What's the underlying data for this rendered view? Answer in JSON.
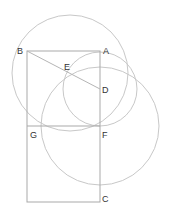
{
  "diagram": {
    "type": "geometric-construction",
    "points": {
      "A": {
        "label": "A",
        "x": 100,
        "y": 51
      },
      "B": {
        "label": "B",
        "x": 27,
        "y": 51
      },
      "C": {
        "label": "C",
        "x": 100,
        "y": 202
      },
      "D": {
        "label": "D",
        "x": 100,
        "y": 89
      },
      "E": {
        "label": "E",
        "x": 70,
        "y": 73
      },
      "F": {
        "label": "F",
        "x": 100,
        "y": 126
      },
      "G": {
        "label": "G",
        "x": 27,
        "y": 126
      }
    },
    "rectangle": {
      "corners": [
        "B",
        "A",
        "C"
      ],
      "x": 27,
      "y": 51,
      "width": 73,
      "height": 151
    },
    "segments": [
      {
        "from": "B",
        "to": "D"
      },
      {
        "from": "G",
        "to": "F"
      }
    ],
    "circles": [
      {
        "name": "circle-center-E",
        "cx": 70,
        "cy": 73,
        "r": 58
      },
      {
        "name": "circle-center-D",
        "cx": 100,
        "cy": 89,
        "r": 37
      },
      {
        "name": "circle-center-F",
        "cx": 100,
        "cy": 126,
        "r": 59
      }
    ],
    "colors": {
      "lines": "#a9a9a9",
      "circles": "#c8c8c8",
      "labels": "#333333"
    }
  }
}
